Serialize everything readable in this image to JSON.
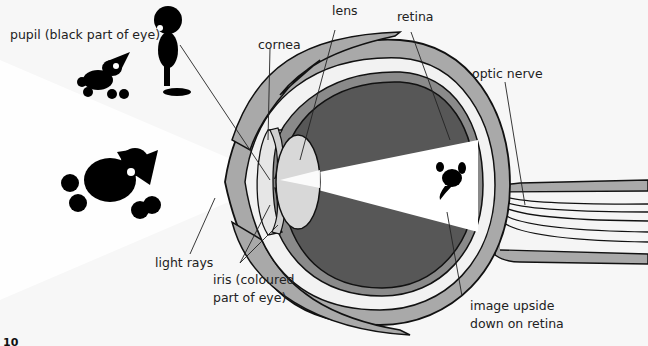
{
  "diagram": {
    "labels": {
      "pupil": "pupil (black part of eye)",
      "lens": "lens",
      "retina": "retina",
      "cornea": "cornea",
      "optic_nerve": "optic nerve",
      "light_rays": "light rays",
      "iris_line1": "iris (coloured",
      "iris_line2": "part of eye)",
      "image_line1": "image upside",
      "image_line2": "down on retina"
    },
    "figures": [
      "small-dog-figure",
      "boy-figure",
      "large-dog-figure",
      "inverted-dog-image"
    ],
    "colors": {
      "background": "#f7f7f7",
      "sclera": "#a9a9a9",
      "vitreous": "#575757",
      "lens": "#d8d8d8",
      "light_beam": "#ffffff",
      "outline": "#111111"
    }
  },
  "page": {
    "number": "10"
  }
}
